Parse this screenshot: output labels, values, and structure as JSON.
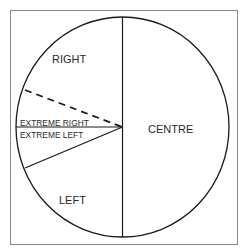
{
  "diagram": {
    "type": "circle-segment-diagram",
    "frame_color": "#8a8a8a",
    "line_color": "#1a1a1a",
    "background": "#ffffff",
    "labels": {
      "right": "RIGHT",
      "extreme_right": "EXTREME RIGHT",
      "extreme_left": "EXTREME LEFT",
      "left": "LEFT",
      "centre": "CENTRE"
    },
    "segments": [
      {
        "name": "RIGHT",
        "side": "left-upper",
        "boundary": "vertical divider and dashed line"
      },
      {
        "name": "EXTREME RIGHT",
        "side": "left-middle-upper",
        "boundary": "dashed line and horizontal line"
      },
      {
        "name": "EXTREME LEFT",
        "side": "left-middle-lower",
        "boundary": "horizontal line and solid diagonal"
      },
      {
        "name": "LEFT",
        "side": "left-lower",
        "boundary": "solid diagonal and vertical divider"
      },
      {
        "name": "CENTRE",
        "side": "right-half",
        "boundary": "vertical divider"
      }
    ],
    "dividers": [
      {
        "name": "vertical-divider",
        "style": "solid"
      },
      {
        "name": "horizontal-radius",
        "style": "solid"
      },
      {
        "name": "upper-diagonal-radius",
        "style": "dashed"
      },
      {
        "name": "lower-diagonal-radius",
        "style": "solid"
      }
    ]
  }
}
